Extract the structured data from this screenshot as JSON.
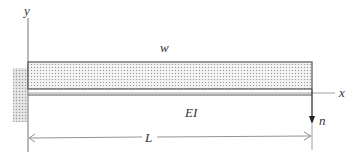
{
  "diagram": {
    "type": "cantilever-beam",
    "labels": {
      "y_axis": "y",
      "x_axis": "x",
      "distributed_load": "w",
      "stiffness": "EI",
      "tip_load": "n",
      "length": "L"
    },
    "colors": {
      "line": "#555555",
      "fill_dots": "#888888",
      "text": "#333333"
    }
  }
}
